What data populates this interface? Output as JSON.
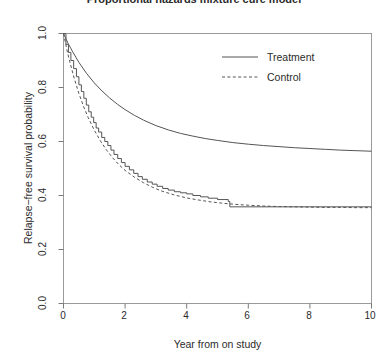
{
  "chart_data": {
    "type": "line",
    "title": "Proportional hazards mixture cure model",
    "xlabel": "Year from on study",
    "ylabel": "Relapse−free survival probability",
    "xlim": [
      0,
      10
    ],
    "ylim": [
      0.0,
      1.0
    ],
    "grid": false,
    "legend_position": "top-right",
    "xticks": [
      "0",
      "2",
      "4",
      "6",
      "8",
      "10"
    ],
    "xtick_values": [
      0,
      2,
      4,
      6,
      8,
      10
    ],
    "yticks": [
      "0.0",
      "0.2",
      "0.4",
      "0.6",
      "0.8",
      "1.0"
    ],
    "ytick_values": [
      0.0,
      0.2,
      0.4,
      0.6,
      0.8,
      1.0
    ],
    "series": [
      {
        "name": "Treatment",
        "style": "solid",
        "color": "#4d4d4d",
        "cure_fraction": 0.56,
        "x": [
          0.0,
          0.15,
          0.3,
          0.5,
          0.75,
          1.0,
          1.25,
          1.5,
          1.75,
          2.0,
          2.3,
          2.6,
          3.0,
          3.4,
          3.8,
          4.2,
          4.6,
          5.0,
          5.5,
          6.0,
          6.5,
          7.0,
          7.5,
          8.0,
          8.5,
          9.0,
          9.5,
          10.0
        ],
        "values": [
          1.0,
          0.963,
          0.932,
          0.893,
          0.852,
          0.817,
          0.787,
          0.761,
          0.738,
          0.718,
          0.697,
          0.679,
          0.659,
          0.643,
          0.63,
          0.62,
          0.611,
          0.604,
          0.596,
          0.59,
          0.585,
          0.581,
          0.577,
          0.574,
          0.571,
          0.568,
          0.566,
          0.564
        ]
      },
      {
        "name": "Control",
        "style": "dashed",
        "color": "#4d4d4d",
        "cure_fraction": 0.355,
        "x": [
          0.0,
          0.1,
          0.2,
          0.35,
          0.5,
          0.65,
          0.8,
          1.0,
          1.2,
          1.4,
          1.6,
          1.8,
          2.0,
          2.3,
          2.6,
          2.9,
          3.2,
          3.6,
          4.0,
          4.4,
          4.8,
          5.2,
          5.6,
          6.0,
          6.5,
          7.0,
          7.5,
          8.0,
          8.5,
          9.0,
          9.5,
          10.0
        ],
        "values": [
          1.0,
          0.945,
          0.897,
          0.833,
          0.778,
          0.73,
          0.689,
          0.642,
          0.602,
          0.568,
          0.539,
          0.514,
          0.493,
          0.468,
          0.447,
          0.43,
          0.416,
          0.402,
          0.391,
          0.383,
          0.376,
          0.371,
          0.367,
          0.364,
          0.361,
          0.359,
          0.358,
          0.357,
          0.356,
          0.356,
          0.355,
          0.355
        ]
      },
      {
        "name": "Kaplan-Meier empirical",
        "style": "step",
        "color": "#4d4d4d",
        "plateau": 0.358,
        "x": [
          0.0,
          0.08,
          0.16,
          0.24,
          0.33,
          0.42,
          0.5,
          0.58,
          0.66,
          0.74,
          0.82,
          0.9,
          0.98,
          1.06,
          1.14,
          1.24,
          1.34,
          1.44,
          1.54,
          1.64,
          1.76,
          1.88,
          2.0,
          2.14,
          2.28,
          2.42,
          2.56,
          2.72,
          2.88,
          3.04,
          3.22,
          3.4,
          3.6,
          3.8,
          4.0,
          4.2,
          4.45,
          4.7,
          5.0,
          5.35,
          5.4,
          10.0
        ],
        "values": [
          1.0,
          0.96,
          0.93,
          0.9,
          0.87,
          0.84,
          0.81,
          0.785,
          0.76,
          0.735,
          0.71,
          0.69,
          0.67,
          0.65,
          0.635,
          0.615,
          0.6,
          0.585,
          0.568,
          0.552,
          0.537,
          0.522,
          0.508,
          0.495,
          0.482,
          0.47,
          0.46,
          0.45,
          0.442,
          0.434,
          0.426,
          0.42,
          0.414,
          0.41,
          0.406,
          0.4,
          0.395,
          0.39,
          0.385,
          0.378,
          0.358,
          0.358
        ]
      }
    ]
  },
  "legend": {
    "entries": [
      {
        "label": "Treatment",
        "style": "solid"
      },
      {
        "label": "Control",
        "style": "dashed"
      }
    ]
  }
}
